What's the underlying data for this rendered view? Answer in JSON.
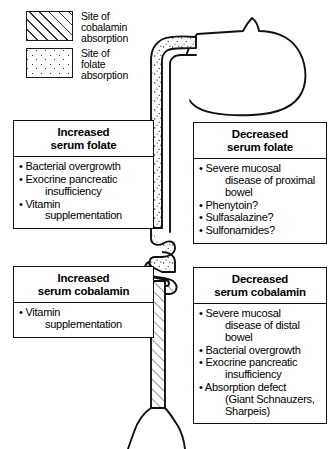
{
  "legend": {
    "items": [
      {
        "swatch": "diagonal-hatch",
        "lines": [
          "Site of",
          "cobalamin",
          "absorption"
        ]
      },
      {
        "swatch": "dot-stipple",
        "lines": [
          "Site of",
          "folate",
          "absorption"
        ]
      }
    ]
  },
  "boxes": {
    "increased_folate": {
      "title_line1": "Increased",
      "title_line2": "serum folate",
      "items": [
        {
          "main": "Bacterial overgrowth",
          "cont": ""
        },
        {
          "main": "Exocrine pancreatic",
          "cont": "insufficiency"
        },
        {
          "main": "Vitamin",
          "cont": "supplementation"
        }
      ]
    },
    "decreased_folate": {
      "title_line1": "Decreased",
      "title_line2": "serum folate",
      "items": [
        {
          "main": "Severe mucosal",
          "cont": "disease of proximal",
          "cont2": "bowel"
        },
        {
          "main": "Phenytoin?",
          "cont": ""
        },
        {
          "main": "Sulfasalazine?",
          "cont": ""
        },
        {
          "main": "Sulfonamides?",
          "cont": ""
        }
      ]
    },
    "increased_cobalamin": {
      "title_line1": "Increased",
      "title_line2": "serum cobalamin",
      "items": [
        {
          "main": "Vitamin",
          "cont": "supplementation"
        }
      ]
    },
    "decreased_cobalamin": {
      "title_line1": "Decreased",
      "title_line2": "serum cobalamin",
      "items": [
        {
          "main": "Severe mucosal",
          "cont": "disease of distal",
          "cont2": "bowel"
        },
        {
          "main": "Bacterial overgrowth",
          "cont": ""
        },
        {
          "main": "Exocrine pancreatic",
          "cont": "insufficiency"
        },
        {
          "main": "Absorption defect",
          "cont": "(Giant Schnauzers,",
          "cont2": "Sharpeis)"
        }
      ]
    }
  },
  "diagram": {
    "name": "gastrointestinal-tract-schematic",
    "bullet": "•",
    "colors": {
      "outline": "#111111",
      "fill": "#ffffff",
      "pattern": "#222222"
    },
    "segments": [
      {
        "name": "esophagus",
        "pattern": "none"
      },
      {
        "name": "stomach",
        "pattern": "none"
      },
      {
        "name": "duodenum-proximal-jejunum",
        "pattern": "dot-stipple"
      },
      {
        "name": "coiled-small-bowel-transition",
        "pattern": "mixed"
      },
      {
        "name": "distal-ileum",
        "pattern": "diagonal-hatch"
      },
      {
        "name": "colon-rectum",
        "pattern": "none"
      }
    ]
  }
}
